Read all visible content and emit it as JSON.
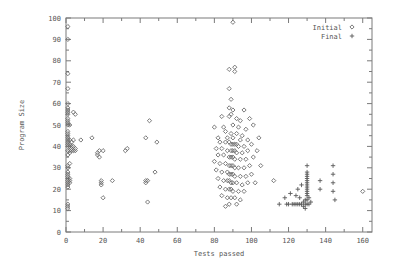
{
  "chart_data": {
    "type": "scatter",
    "title": "",
    "xlabel": "Tests passed",
    "ylabel": "Program Size",
    "xlim": [
      0,
      165
    ],
    "ylim": [
      0,
      100
    ],
    "grid": false,
    "legend_position": "top-right",
    "x_ticks": [
      0,
      20,
      40,
      60,
      80,
      100,
      120,
      140,
      160
    ],
    "y_ticks": [
      0,
      10,
      20,
      30,
      40,
      50,
      60,
      70,
      80,
      90,
      100
    ],
    "x_minor_ticks": [
      10,
      30,
      50,
      70,
      90,
      110,
      130,
      150
    ],
    "y_minor_ticks": [
      5,
      15,
      25,
      35,
      45,
      55,
      65,
      75,
      85,
      95
    ],
    "series": [
      {
        "name": "Initial",
        "marker": "open-diamond",
        "color": "#6b6b6b",
        "points": [
          [
            1,
            96
          ],
          [
            1,
            90
          ],
          [
            1,
            74
          ],
          [
            1,
            67
          ],
          [
            1,
            60
          ],
          [
            1,
            58
          ],
          [
            1,
            57
          ],
          [
            1,
            56
          ],
          [
            1,
            55
          ],
          [
            4,
            56
          ],
          [
            5,
            55
          ],
          [
            1,
            53
          ],
          [
            1,
            52
          ],
          [
            1,
            51
          ],
          [
            1,
            50
          ],
          [
            2,
            50
          ],
          [
            1,
            47
          ],
          [
            1,
            46
          ],
          [
            1,
            45
          ],
          [
            1,
            44
          ],
          [
            1,
            43
          ],
          [
            2,
            43
          ],
          [
            1,
            42
          ],
          [
            3,
            42
          ],
          [
            4,
            43
          ],
          [
            1,
            41
          ],
          [
            2,
            41
          ],
          [
            1,
            40
          ],
          [
            2,
            40
          ],
          [
            3,
            40
          ],
          [
            4,
            40
          ],
          [
            5,
            39
          ],
          [
            3,
            38
          ],
          [
            2,
            38
          ],
          [
            1,
            38
          ],
          [
            4,
            38
          ],
          [
            5,
            38
          ],
          [
            2,
            37
          ],
          [
            1,
            36
          ],
          [
            3,
            39
          ],
          [
            2,
            32
          ],
          [
            1,
            31
          ],
          [
            1,
            30
          ],
          [
            1,
            28
          ],
          [
            1,
            27
          ],
          [
            1,
            26
          ],
          [
            1,
            25
          ],
          [
            2,
            25
          ],
          [
            1,
            24
          ],
          [
            2,
            24
          ],
          [
            1,
            23
          ],
          [
            2,
            23
          ],
          [
            1,
            22
          ],
          [
            1,
            21
          ],
          [
            1,
            13
          ],
          [
            1,
            12
          ],
          [
            1,
            11
          ],
          [
            8,
            43
          ],
          [
            14,
            44
          ],
          [
            17,
            37
          ],
          [
            17,
            36
          ],
          [
            18,
            38
          ],
          [
            18,
            35
          ],
          [
            20,
            38
          ],
          [
            19,
            24
          ],
          [
            19,
            23
          ],
          [
            19,
            22
          ],
          [
            20,
            16
          ],
          [
            25,
            24
          ],
          [
            33,
            39
          ],
          [
            32,
            38
          ],
          [
            43,
            44
          ],
          [
            43,
            24
          ],
          [
            44,
            24
          ],
          [
            43,
            23
          ],
          [
            48,
            28
          ],
          [
            49,
            42
          ],
          [
            44,
            14
          ],
          [
            45,
            52
          ],
          [
            89,
            55
          ],
          [
            90,
            98
          ],
          [
            88,
            76
          ],
          [
            91,
            75
          ],
          [
            91,
            77
          ],
          [
            88,
            67
          ],
          [
            89,
            62
          ],
          [
            88,
            58
          ],
          [
            90,
            57
          ],
          [
            96,
            57
          ],
          [
            84,
            54
          ],
          [
            88,
            54
          ],
          [
            92,
            53
          ],
          [
            94,
            52
          ],
          [
            99,
            53
          ],
          [
            80,
            49
          ],
          [
            85,
            49
          ],
          [
            90,
            50
          ],
          [
            93,
            49
          ],
          [
            97,
            48
          ],
          [
            101,
            50
          ],
          [
            86,
            47
          ],
          [
            89,
            46
          ],
          [
            92,
            46
          ],
          [
            95,
            45
          ],
          [
            82,
            44
          ],
          [
            87,
            44
          ],
          [
            90,
            44
          ],
          [
            94,
            43
          ],
          [
            98,
            43
          ],
          [
            104,
            44
          ],
          [
            83,
            42
          ],
          [
            86,
            42
          ],
          [
            88,
            42
          ],
          [
            89,
            41
          ],
          [
            90,
            41
          ],
          [
            91,
            41
          ],
          [
            92,
            41
          ],
          [
            93,
            40
          ],
          [
            96,
            40
          ],
          [
            100,
            41
          ],
          [
            81,
            39
          ],
          [
            84,
            39
          ],
          [
            87,
            38
          ],
          [
            89,
            38
          ],
          [
            90,
            38
          ],
          [
            91,
            38
          ],
          [
            92,
            37
          ],
          [
            95,
            37
          ],
          [
            98,
            38
          ],
          [
            103,
            38
          ],
          [
            82,
            36
          ],
          [
            85,
            36
          ],
          [
            88,
            35
          ],
          [
            89,
            35
          ],
          [
            90,
            35
          ],
          [
            91,
            34
          ],
          [
            94,
            34
          ],
          [
            97,
            34
          ],
          [
            101,
            35
          ],
          [
            80,
            33
          ],
          [
            83,
            32
          ],
          [
            86,
            32
          ],
          [
            88,
            31
          ],
          [
            89,
            31
          ],
          [
            90,
            31
          ],
          [
            91,
            30
          ],
          [
            93,
            30
          ],
          [
            96,
            30
          ],
          [
            99,
            31
          ],
          [
            105,
            31
          ],
          [
            81,
            29
          ],
          [
            84,
            28
          ],
          [
            87,
            28
          ],
          [
            88,
            27
          ],
          [
            89,
            27
          ],
          [
            90,
            27
          ],
          [
            91,
            26
          ],
          [
            94,
            26
          ],
          [
            97,
            26
          ],
          [
            100,
            27
          ],
          [
            82,
            25
          ],
          [
            85,
            24
          ],
          [
            87,
            24
          ],
          [
            88,
            24
          ],
          [
            89,
            23
          ],
          [
            90,
            23
          ],
          [
            92,
            23
          ],
          [
            95,
            22
          ],
          [
            98,
            23
          ],
          [
            102,
            23
          ],
          [
            83,
            21
          ],
          [
            86,
            20
          ],
          [
            88,
            20
          ],
          [
            89,
            20
          ],
          [
            90,
            19
          ],
          [
            93,
            19
          ],
          [
            96,
            19
          ],
          [
            84,
            17
          ],
          [
            87,
            16
          ],
          [
            89,
            16
          ],
          [
            91,
            16
          ],
          [
            94,
            15
          ],
          [
            88,
            13
          ],
          [
            92,
            13
          ],
          [
            86,
            12
          ],
          [
            112,
            24
          ],
          [
            160,
            19
          ]
        ]
      },
      {
        "name": "Final",
        "marker": "plus",
        "color": "#5a5a5a",
        "points": [
          [
            115,
            13
          ],
          [
            118,
            16
          ],
          [
            119,
            13
          ],
          [
            120,
            13
          ],
          [
            121,
            18
          ],
          [
            122,
            13
          ],
          [
            123,
            13
          ],
          [
            124,
            13
          ],
          [
            124,
            17
          ],
          [
            125,
            13
          ],
          [
            125,
            20
          ],
          [
            126,
            13
          ],
          [
            126,
            16
          ],
          [
            127,
            13
          ],
          [
            127,
            22
          ],
          [
            128,
            12
          ],
          [
            128,
            14
          ],
          [
            129,
            11
          ],
          [
            129,
            13
          ],
          [
            129,
            15
          ],
          [
            130,
            13
          ],
          [
            130,
            15
          ],
          [
            130,
            17
          ],
          [
            130,
            18
          ],
          [
            130,
            19
          ],
          [
            130,
            20
          ],
          [
            130,
            21
          ],
          [
            130,
            22
          ],
          [
            130,
            23
          ],
          [
            130,
            24
          ],
          [
            130,
            25
          ],
          [
            130,
            26
          ],
          [
            130,
            27
          ],
          [
            130,
            28
          ],
          [
            131,
            13
          ],
          [
            131,
            16
          ],
          [
            132,
            14
          ],
          [
            130,
            31
          ],
          [
            137,
            20
          ],
          [
            137,
            24
          ],
          [
            144,
            31
          ],
          [
            144,
            27
          ],
          [
            144,
            23
          ],
          [
            144,
            19
          ],
          [
            145,
            15
          ]
        ]
      }
    ]
  },
  "legend": {
    "entries": [
      {
        "label": "Initial",
        "marker": "open-diamond"
      },
      {
        "label": "Final",
        "marker": "plus"
      }
    ]
  },
  "axes": {
    "x_tick_labels": [
      "0",
      "20",
      "40",
      "60",
      "80",
      "100",
      "120",
      "140",
      "160"
    ],
    "y_tick_labels": [
      "0",
      "10",
      "20",
      "30",
      "40",
      "50",
      "60",
      "70",
      "80",
      "90",
      "100"
    ],
    "x_title": "Tests passed",
    "y_title": "Program Size"
  },
  "colors": {
    "frame": "#7a7a7a",
    "text": "#555555",
    "initial_marker": "#6b6b6b",
    "final_marker": "#5a5a5a",
    "background": "#ffffff"
  }
}
